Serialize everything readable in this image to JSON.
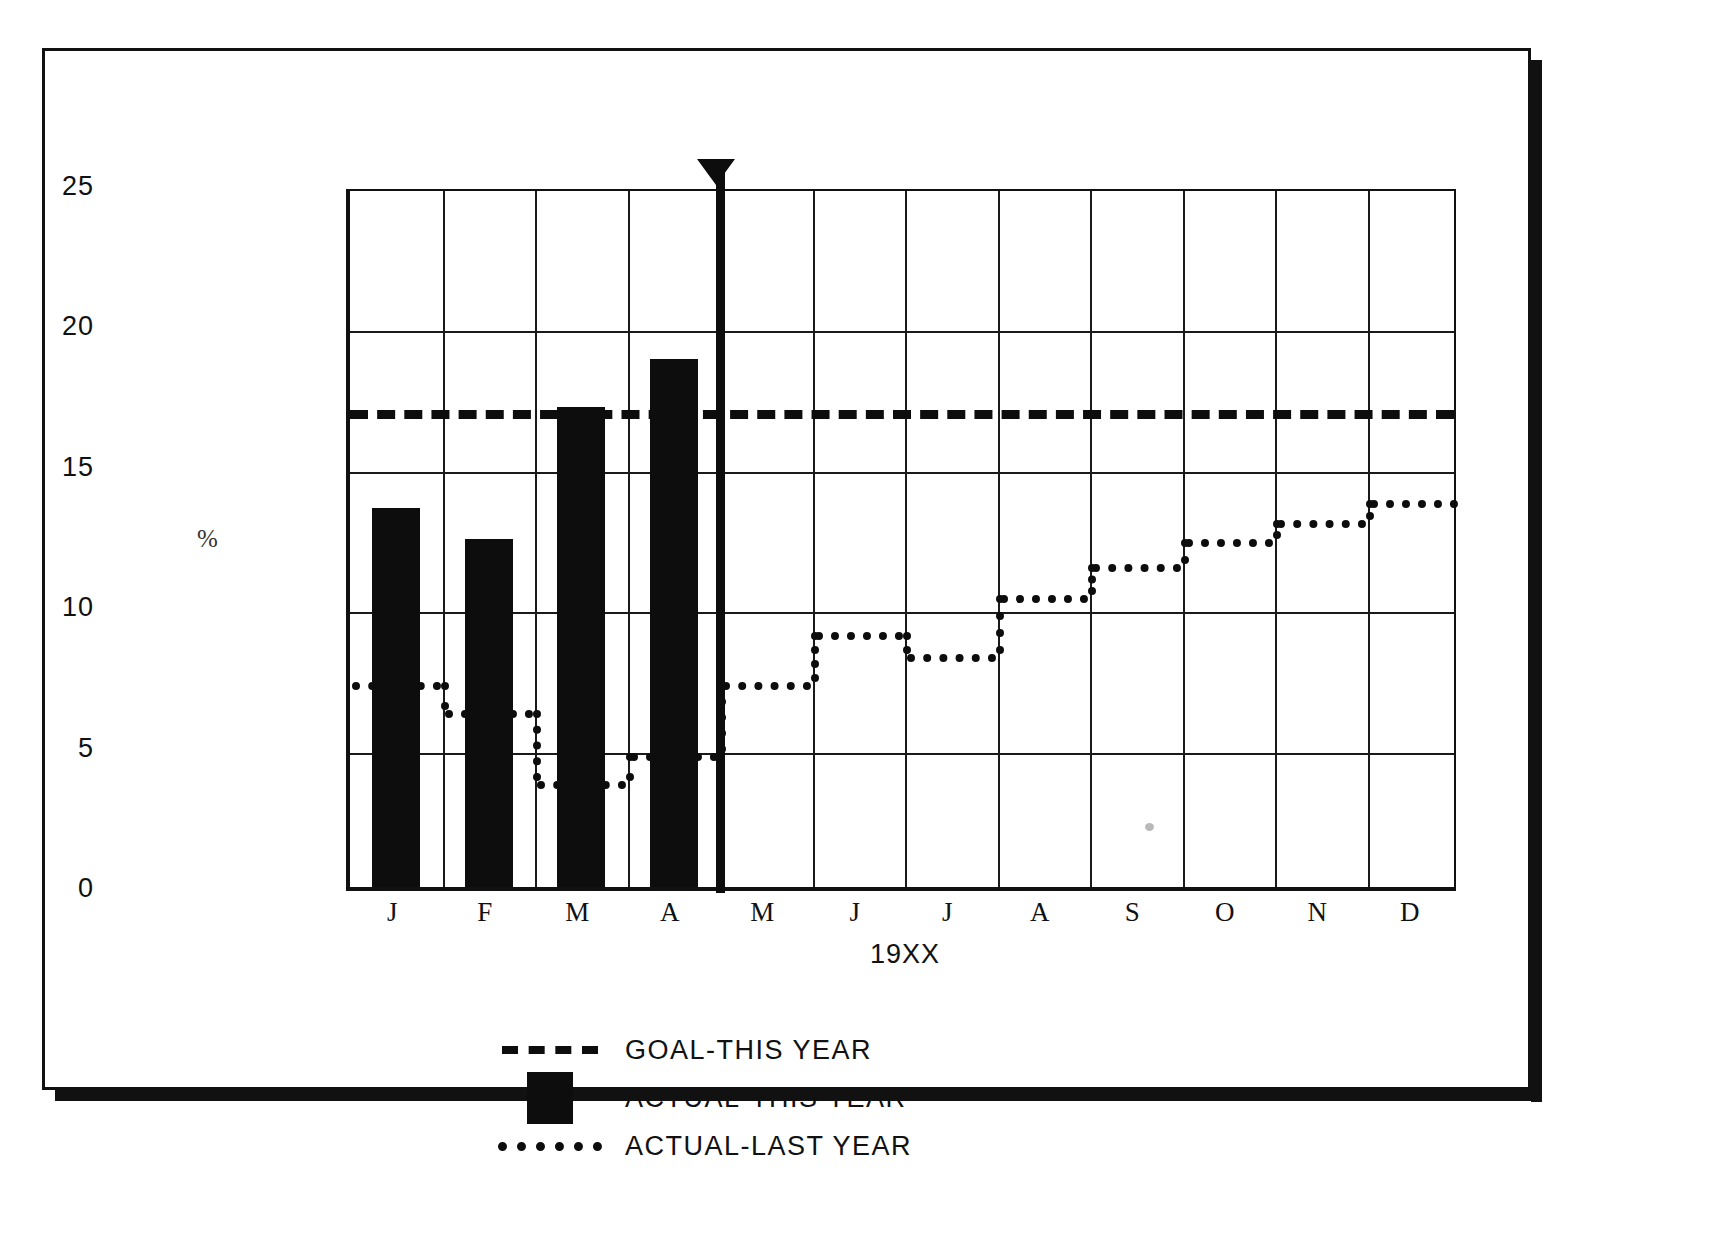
{
  "chart_data": {
    "type": "bar",
    "title": "",
    "subtitle": "",
    "xlabel": "19XX",
    "ylabel": "%",
    "ylim": [
      0,
      25
    ],
    "ytick_labels": [
      "25",
      "20",
      "15",
      "10",
      "5",
      "0"
    ],
    "ytick_values": [
      25,
      20,
      15,
      10,
      5,
      0
    ],
    "grid": true,
    "legend_position": "below-left",
    "categories": [
      "J",
      "F",
      "M",
      "A",
      "M",
      "J",
      "J",
      "A",
      "S",
      "O",
      "N",
      "D"
    ],
    "category_names": [
      "January",
      "February",
      "March",
      "April",
      "May",
      "June",
      "July",
      "August",
      "September",
      "October",
      "November",
      "December"
    ],
    "series": [
      {
        "name": "ACTUAL-THIS YEAR",
        "style": "bar",
        "color": "#0d0d0d",
        "values": [
          13.5,
          12.4,
          17.1,
          18.8,
          null,
          null,
          null,
          null,
          null,
          null,
          null,
          null
        ]
      },
      {
        "name": "ACTUAL-LAST YEAR",
        "style": "dotted-step",
        "color": "#0d0d0d",
        "values": [
          7.5,
          6.5,
          4.0,
          5.0,
          7.5,
          9.3,
          8.5,
          10.6,
          11.7,
          12.6,
          13.3,
          14.0
        ]
      },
      {
        "name": "GOAL-THIS YEAR",
        "style": "dashed-line",
        "color": "#0d0d0d",
        "value": 17.2
      }
    ],
    "annotations": [
      {
        "name": "current-period-marker",
        "type": "vertical-line-with-arrow",
        "x_category_boundary_after": "A",
        "label": ""
      }
    ]
  },
  "axes": {
    "y_label": "%",
    "x_label": "19XX",
    "y_ticks": [
      "25",
      "20",
      "15",
      "10",
      "5",
      "0"
    ],
    "x_ticks": [
      "J",
      "F",
      "M",
      "A",
      "M",
      "J",
      "J",
      "A",
      "S",
      "O",
      "N",
      "D"
    ]
  },
  "legend": {
    "items": [
      {
        "key": "dashed-line-swatch",
        "label": "GOAL-THIS YEAR"
      },
      {
        "key": "solid-block-swatch",
        "label": "ACTUAL-THIS YEAR"
      },
      {
        "key": "dotted-line-swatch",
        "label": "ACTUAL-LAST YEAR"
      }
    ]
  },
  "caption": {
    "text": ""
  }
}
